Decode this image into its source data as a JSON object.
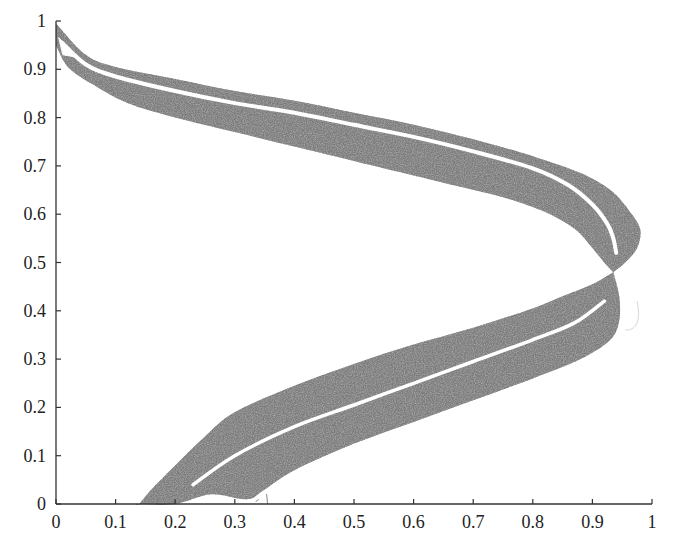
{
  "chart_data": {
    "type": "scatter",
    "title": "",
    "xlabel": "",
    "ylabel": "",
    "xlim": [
      0,
      1
    ],
    "ylim": [
      0,
      1
    ],
    "grid": false,
    "legend": null,
    "x_ticks": [
      "0",
      "0.1",
      "0.2",
      "0.3",
      "0.4",
      "0.5",
      "0.6",
      "0.7",
      "0.8",
      "0.9",
      "1"
    ],
    "y_ticks": [
      "0",
      "0.1",
      "0.2",
      "0.3",
      "0.4",
      "0.5",
      "0.6",
      "0.7",
      "0.8",
      "0.9",
      "1"
    ],
    "point_color": "#555555",
    "series": [
      {
        "name": "upper-band",
        "outer_edge": [
          [
            0.0,
            0.995
          ],
          [
            0.05,
            0.93
          ],
          [
            0.1,
            0.905
          ],
          [
            0.2,
            0.88
          ],
          [
            0.3,
            0.855
          ],
          [
            0.4,
            0.835
          ],
          [
            0.5,
            0.81
          ],
          [
            0.6,
            0.785
          ],
          [
            0.7,
            0.755
          ],
          [
            0.8,
            0.72
          ],
          [
            0.88,
            0.685
          ],
          [
            0.93,
            0.65
          ],
          [
            0.96,
            0.61
          ],
          [
            0.98,
            0.57
          ],
          [
            0.975,
            0.53
          ],
          [
            0.955,
            0.5
          ],
          [
            0.935,
            0.48
          ]
        ],
        "inner_edge": [
          [
            0.935,
            0.48
          ],
          [
            0.92,
            0.5
          ],
          [
            0.9,
            0.53
          ],
          [
            0.87,
            0.57
          ],
          [
            0.82,
            0.605
          ],
          [
            0.75,
            0.635
          ],
          [
            0.65,
            0.665
          ],
          [
            0.5,
            0.71
          ],
          [
            0.4,
            0.74
          ],
          [
            0.3,
            0.77
          ],
          [
            0.2,
            0.8
          ],
          [
            0.12,
            0.83
          ],
          [
            0.06,
            0.87
          ],
          [
            0.02,
            0.905
          ],
          [
            0.0,
            0.95
          ]
        ],
        "gap_line": [
          [
            0.01,
            0.955
          ],
          [
            0.05,
            0.91
          ],
          [
            0.1,
            0.885
          ],
          [
            0.2,
            0.855
          ],
          [
            0.3,
            0.83
          ],
          [
            0.4,
            0.81
          ],
          [
            0.5,
            0.785
          ],
          [
            0.6,
            0.76
          ],
          [
            0.7,
            0.73
          ],
          [
            0.8,
            0.695
          ],
          [
            0.86,
            0.66
          ],
          [
            0.9,
            0.62
          ],
          [
            0.925,
            0.58
          ],
          [
            0.935,
            0.55
          ],
          [
            0.94,
            0.52
          ]
        ]
      },
      {
        "name": "lower-band",
        "outer_edge": [
          [
            0.935,
            0.48
          ],
          [
            0.9,
            0.455
          ],
          [
            0.85,
            0.43
          ],
          [
            0.8,
            0.405
          ],
          [
            0.7,
            0.365
          ],
          [
            0.6,
            0.33
          ],
          [
            0.5,
            0.29
          ],
          [
            0.4,
            0.245
          ],
          [
            0.3,
            0.19
          ],
          [
            0.25,
            0.14
          ],
          [
            0.2,
            0.08
          ],
          [
            0.16,
            0.03
          ],
          [
            0.14,
            0.0
          ]
        ],
        "inner_edge": [
          [
            0.14,
            0.0
          ],
          [
            0.2,
            0.0
          ],
          [
            0.26,
            0.02
          ],
          [
            0.32,
            0.01
          ],
          [
            0.35,
            0.03
          ],
          [
            0.4,
            0.07
          ],
          [
            0.5,
            0.125
          ],
          [
            0.6,
            0.17
          ],
          [
            0.7,
            0.215
          ],
          [
            0.8,
            0.26
          ],
          [
            0.88,
            0.3
          ],
          [
            0.93,
            0.34
          ],
          [
            0.945,
            0.38
          ],
          [
            0.945,
            0.43
          ],
          [
            0.935,
            0.48
          ]
        ],
        "gap_line": [
          [
            0.23,
            0.04
          ],
          [
            0.3,
            0.1
          ],
          [
            0.4,
            0.16
          ],
          [
            0.5,
            0.205
          ],
          [
            0.6,
            0.25
          ],
          [
            0.7,
            0.295
          ],
          [
            0.8,
            0.34
          ],
          [
            0.87,
            0.375
          ],
          [
            0.92,
            0.42
          ]
        ]
      }
    ],
    "artifacts": [
      {
        "type": "faint-arc",
        "near": [
          0.98,
          0.38
        ],
        "color": "#dddddd"
      },
      {
        "type": "small-fragments",
        "near": [
          0.33,
          0.01
        ],
        "color": "#888888"
      }
    ]
  },
  "plot_area": {
    "left_px": 56,
    "right_px": 652,
    "top_px": 21,
    "bottom_px": 504
  }
}
